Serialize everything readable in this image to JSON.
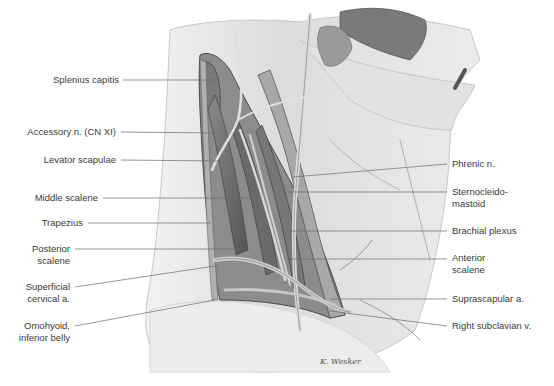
{
  "figure": {
    "type": "anatomical illustration",
    "signature": "K. Wesker"
  },
  "labels_left": [
    {
      "id": "splenius-capitis",
      "lines": [
        "Splenius capitis"
      ],
      "text_x": 119,
      "text_y": 74,
      "line_y": 80,
      "target": [
        217,
        80
      ]
    },
    {
      "id": "accessory-n",
      "lines": [
        "Accessory n. (CN XI)"
      ],
      "text_x": 116,
      "text_y": 126,
      "line_y": 132,
      "target": [
        218,
        133
      ]
    },
    {
      "id": "levator-scapulae",
      "lines": [
        "Levator scapulae"
      ],
      "text_x": 116,
      "text_y": 154,
      "line_y": 160,
      "target": [
        220,
        161
      ]
    },
    {
      "id": "middle-scalene",
      "lines": [
        "Middle scalene"
      ],
      "text_x": 98,
      "text_y": 193,
      "line_y": 198,
      "target": [
        258,
        198
      ]
    },
    {
      "id": "trapezius",
      "lines": [
        "Trapezius"
      ],
      "text_x": 83,
      "text_y": 217,
      "line_y": 223,
      "target": [
        211,
        223
      ]
    },
    {
      "id": "posterior-scalene",
      "lines": [
        "Posterior",
        "scalene"
      ],
      "text_x": 70,
      "text_y": 244,
      "line_y": 249,
      "target": [
        233,
        249
      ]
    },
    {
      "id": "superficial-cervical-a",
      "lines": [
        "Superficial",
        "cervical a."
      ],
      "text_x": 70,
      "text_y": 283,
      "line_y": 287,
      "target": [
        215,
        266
      ]
    },
    {
      "id": "omohyoid-inferior-belly",
      "lines": [
        "Omohyoid,",
        "inferior belly"
      ],
      "text_x": 70,
      "text_y": 323,
      "line_y": 326,
      "target": [
        215,
        300
      ]
    }
  ],
  "labels_right": [
    {
      "id": "phrenic-n",
      "lines": [
        "Phrenic n."
      ],
      "text_x": 452,
      "text_y": 158,
      "line_y": 164,
      "target": [
        293,
        177
      ]
    },
    {
      "id": "sternocleidomastoid",
      "lines": [
        "Sternocleido-",
        "mastoid"
      ],
      "text_x": 452,
      "text_y": 186,
      "line_y": 192,
      "target": [
        283,
        192
      ]
    },
    {
      "id": "brachial-plexus",
      "lines": [
        "Brachial plexus"
      ],
      "text_x": 452,
      "text_y": 225,
      "line_y": 231,
      "target": [
        281,
        231
      ]
    },
    {
      "id": "anterior-scalene",
      "lines": [
        "Anterior",
        "scalene"
      ],
      "text_x": 452,
      "text_y": 252,
      "line_y": 259,
      "target": [
        285,
        259
      ]
    },
    {
      "id": "suprascapular-a",
      "lines": [
        "Suprascapular a."
      ],
      "text_x": 452,
      "text_y": 293,
      "line_y": 299,
      "target": [
        330,
        299
      ]
    },
    {
      "id": "right-subclavian-v",
      "lines": [
        "Right subclavian v."
      ],
      "text_x": 452,
      "text_y": 320,
      "line_y": 326,
      "target": [
        330,
        311
      ]
    }
  ],
  "colors": {
    "background": "#ffffff",
    "label_text": "#3a3a3a",
    "leader_line": "#6a6a6a",
    "skin_light": "#e9e9e9",
    "skin_mid": "#cfcfcf",
    "muscle_dark": "#6e6e6e",
    "vessel": "#bdbdbd"
  }
}
